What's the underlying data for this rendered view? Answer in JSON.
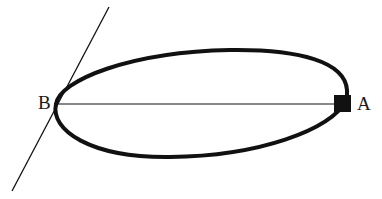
{
  "diagram": {
    "type": "orbit-ellipse-with-tangent",
    "labels": {
      "point_a": "A",
      "point_b": "B"
    },
    "colors": {
      "stroke": "#111111",
      "background": "#ffffff"
    },
    "elements": [
      {
        "kind": "ellipse",
        "description": "elongated closed orbit (thick stroke)"
      },
      {
        "kind": "line",
        "description": "major axis from B to A"
      },
      {
        "kind": "tangent-line",
        "description": "straight line tangent to ellipse at B"
      },
      {
        "kind": "square-marker",
        "description": "filled black square at A"
      }
    ]
  }
}
